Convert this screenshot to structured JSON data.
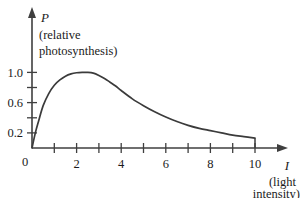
{
  "chart_data": {
    "type": "line",
    "title": "",
    "subtitle": "",
    "xlabel": "I",
    "xlabel_desc_line1": "(light",
    "xlabel_desc_line2": "intensity)",
    "ylabel": "P",
    "ylabel_desc_line1": "(relative",
    "ylabel_desc_line2": "photosynthesis)",
    "xlim": [
      0,
      11.3
    ],
    "ylim": [
      0,
      1.28
    ],
    "grid": false,
    "legend": "none",
    "x_ticks": [
      1,
      2,
      3,
      4,
      5,
      6,
      7,
      8,
      9,
      10
    ],
    "x_tick_labels": [
      "",
      "2",
      "",
      "4",
      "",
      "6",
      "",
      "8",
      "",
      "10"
    ],
    "origin_label": "0",
    "y_ticks": [
      0.2,
      0.4,
      0.6,
      0.8,
      1.0
    ],
    "y_tick_labels": [
      "0.2",
      "",
      "0.6",
      "",
      "1.0"
    ],
    "series": [
      {
        "name": "relative photosynthesis",
        "color": "#3b3b3b",
        "x": [
          0,
          0.15,
          0.3,
          0.5,
          0.75,
          1.0,
          1.25,
          1.5,
          1.75,
          2.0,
          2.25,
          2.5,
          2.75,
          3.0,
          3.25,
          3.5,
          3.75,
          4.0,
          4.5,
          5.0,
          5.5,
          6.0,
          6.5,
          7.0,
          7.5,
          8.0,
          8.5,
          9.0,
          9.5,
          10.0
        ],
        "y": [
          0.0,
          0.2,
          0.36,
          0.56,
          0.72,
          0.83,
          0.9,
          0.95,
          0.98,
          0.995,
          1.0,
          1.0,
          0.99,
          0.96,
          0.92,
          0.87,
          0.82,
          0.76,
          0.65,
          0.56,
          0.48,
          0.41,
          0.35,
          0.3,
          0.26,
          0.23,
          0.2,
          0.17,
          0.15,
          0.13
        ]
      }
    ],
    "end_drop": {
      "x": 10.0,
      "y_from": 0.13,
      "y_to": 0.0
    },
    "peak": {
      "x": 2.4,
      "y": 1.0
    },
    "background_color": "#ffffff",
    "axis_color": "#3f3f3f"
  }
}
